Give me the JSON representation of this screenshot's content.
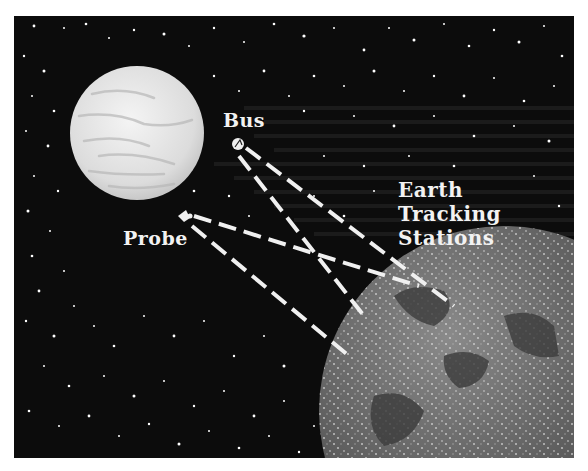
{
  "illustration": {
    "labels": {
      "bus": "Bus",
      "probe": "Probe",
      "earth_tracking": [
        "Earth",
        "Tracking",
        "Stations"
      ]
    },
    "objects": [
      "venus-planet",
      "bus-spacecraft",
      "probe-spacecraft",
      "earth-globe"
    ],
    "colors": {
      "background": "#0c0c0c",
      "frame_border": "#ffffff",
      "text": "#f2f2f2",
      "venus": "#e6e6e6",
      "earth": "#6a6a6a",
      "signal_lines": "#f0f0f0"
    }
  }
}
